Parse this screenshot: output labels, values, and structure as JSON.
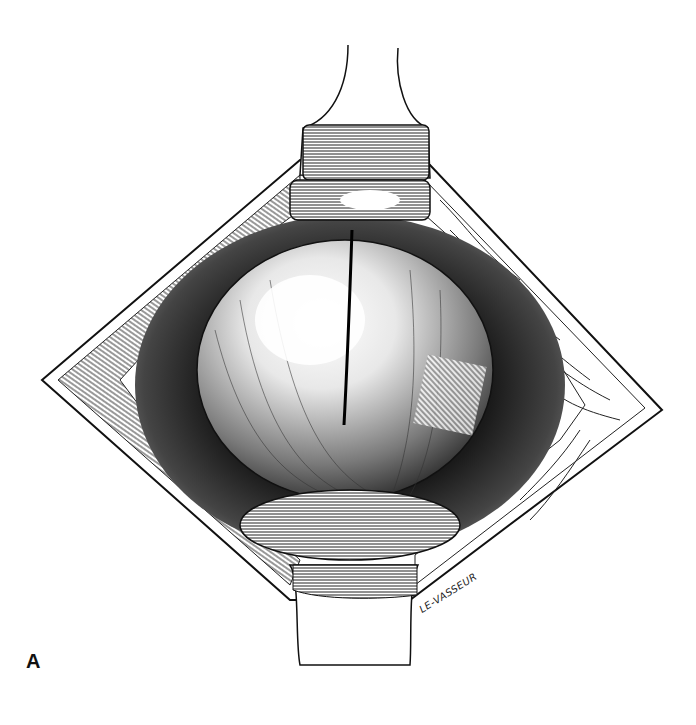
{
  "figure": {
    "panel_label": "A",
    "artist_signature": "LE-VASSEUR",
    "palette": {
      "background": "#ffffff",
      "ink": "#111111",
      "mid_tone": "#555555",
      "light_tone": "#bbbbbb"
    }
  }
}
